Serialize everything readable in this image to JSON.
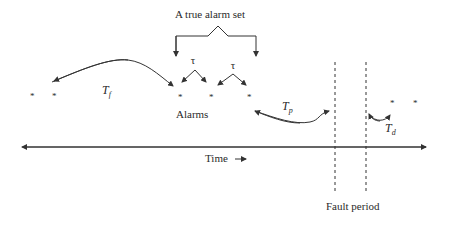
{
  "labels": {
    "true_alarm_set": "A true alarm set",
    "tau_1": "τ",
    "tau_2": "τ",
    "t_f": "T",
    "t_f_sub": "f",
    "t_p": "T",
    "t_p_sub": "p",
    "t_d": "T",
    "t_d_sub": "d",
    "alarms": "Alarms",
    "time": "Time",
    "time_arrow": "⟶",
    "fault_period": "Fault period"
  },
  "alarm_markers": [
    "*",
    "*",
    "*",
    "*",
    "*",
    "*",
    "*"
  ],
  "colors": {
    "stroke": "#333333",
    "text": "#2a2a2a",
    "background": "#ffffff"
  }
}
